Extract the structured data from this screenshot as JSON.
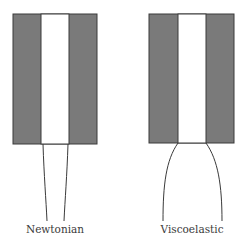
{
  "diagram": {
    "colors": {
      "wall_fill": "#7a7a7a",
      "stroke": "#3a3a3a",
      "channel_fill": "#ffffff",
      "background": "#ffffff"
    },
    "panels": [
      {
        "id": "newtonian",
        "label": "Newtonian",
        "die": {
          "x": 13,
          "y": 14,
          "width": 84,
          "height": 130,
          "channel_x": 41,
          "channel_width": 28
        },
        "jet": {
          "left_path": "M43,144 C44,175 46,200 47,221",
          "right_path": "M68,144 C67,175 65,200 64,221"
        },
        "label_x": 55,
        "label_y": 223
      },
      {
        "id": "viscoelastic",
        "label": "Viscoelastic",
        "die": {
          "x": 149,
          "y": 14,
          "width": 85,
          "height": 129,
          "channel_x": 178,
          "channel_width": 28
        },
        "jet": {
          "left_path": "M178,143 C166,160 163,185 163,221",
          "right_path": "M206,143 C218,160 222,185 222,221"
        },
        "label_x": 192,
        "label_y": 223
      }
    ]
  }
}
